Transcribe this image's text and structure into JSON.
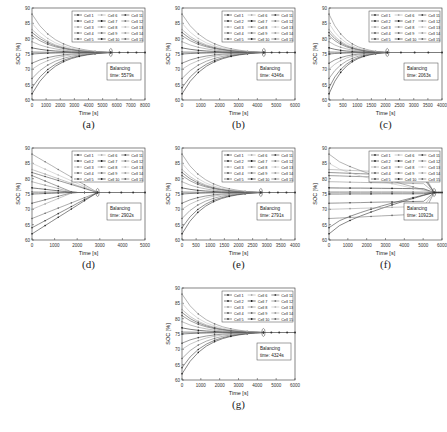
{
  "figure": {
    "cell_names": [
      "Cell 1",
      "Cell 2",
      "Cell 3",
      "Cell 4",
      "Cell 5",
      "Cell 6",
      "Cell 7",
      "Cell 8",
      "Cell 9",
      "Cell 10",
      "Cell 11",
      "Cell 12",
      "Cell 13",
      "Cell 14",
      "Cell 15"
    ],
    "initial_soc": [
      64,
      62,
      83,
      81,
      82,
      75.5,
      77,
      79,
      67,
      75,
      72,
      88,
      85,
      70,
      75.7
    ]
  },
  "chart_data": [
    {
      "id": "a",
      "caption": "(a)",
      "type": "line",
      "xlabel": "Time [s]",
      "ylabel": "SOC [%]",
      "xlim": [
        0,
        8000
      ],
      "ylim": [
        60,
        90
      ],
      "xticks": [
        0,
        1000,
        2000,
        3000,
        4000,
        5000,
        6000,
        7000,
        8000
      ],
      "yticks": [
        60,
        65,
        70,
        75,
        80,
        85,
        90
      ],
      "annotation": "Balancing time: 5579s",
      "balancing_time_s": 5579,
      "final_soc": 75.5,
      "grid": false,
      "legend_position": "upper right"
    },
    {
      "id": "b",
      "caption": "(b)",
      "type": "line",
      "xlabel": "Time [s]",
      "ylabel": "SOC [%]",
      "xlim": [
        0,
        6000
      ],
      "ylim": [
        60,
        90
      ],
      "xticks": [
        0,
        1000,
        2000,
        3000,
        4000,
        5000,
        6000
      ],
      "yticks": [
        60,
        65,
        70,
        75,
        80,
        85,
        90
      ],
      "annotation": "Balancing time: 4346s",
      "balancing_time_s": 4346,
      "final_soc": 75.5,
      "grid": false,
      "legend_position": "upper right"
    },
    {
      "id": "c",
      "caption": "(c)",
      "type": "line",
      "xlabel": "Time [s]",
      "ylabel": "SOC [%]",
      "xlim": [
        0,
        4000
      ],
      "ylim": [
        60,
        90
      ],
      "xticks": [
        0,
        500,
        1000,
        1500,
        2000,
        2500,
        3000,
        3500,
        4000
      ],
      "yticks": [
        60,
        65,
        70,
        75,
        80,
        85,
        90
      ],
      "annotation": "Balancing time: 2063s",
      "balancing_time_s": 2063,
      "final_soc": 75.5,
      "grid": false,
      "legend_position": "upper right"
    },
    {
      "id": "d",
      "caption": "(d)",
      "type": "line",
      "xlabel": "Time [s]",
      "ylabel": "SOC [%]",
      "xlim": [
        0,
        5000
      ],
      "ylim": [
        60,
        90
      ],
      "xticks": [
        0,
        1000,
        2000,
        3000,
        4000,
        5000
      ],
      "yticks": [
        60,
        65,
        70,
        75,
        80,
        85,
        90
      ],
      "annotation": "Balancing time: 2902s",
      "balancing_time_s": 2902,
      "final_soc": 75.5,
      "grid": false,
      "legend_position": "upper right"
    },
    {
      "id": "e",
      "caption": "(e)",
      "type": "line",
      "xlabel": "Time [s]",
      "ylabel": "SOC [%]",
      "xlim": [
        0,
        4000
      ],
      "ylim": [
        60,
        90
      ],
      "xticks": [
        0,
        500,
        1000,
        1500,
        2000,
        2500,
        3000,
        3500,
        4000
      ],
      "yticks": [
        60,
        65,
        70,
        75,
        80,
        85,
        90
      ],
      "annotation": "Balancing time: 2791s",
      "balancing_time_s": 2791,
      "final_soc": 75.5,
      "grid": false,
      "legend_position": "upper right"
    },
    {
      "id": "f",
      "caption": "(f)",
      "type": "line",
      "xlabel": "Time [s]",
      "ylabel": "SOC [%]",
      "xlim": [
        0,
        6000
      ],
      "ylim": [
        60,
        90
      ],
      "xticks": [
        0,
        1000,
        2000,
        3000,
        4000,
        5000,
        6000
      ],
      "yticks": [
        60,
        65,
        70,
        75,
        80,
        85,
        90
      ],
      "annotation": "Balancing time: 10923s",
      "balancing_time_s": 10923,
      "final_soc": 75.5,
      "grid": false,
      "legend_position": "upper right"
    },
    {
      "id": "g",
      "caption": "(g)",
      "type": "line",
      "xlabel": "Time [s]",
      "ylabel": "SOC [%]",
      "xlim": [
        0,
        6000
      ],
      "ylim": [
        60,
        90
      ],
      "xticks": [
        0,
        1000,
        2000,
        3000,
        4000,
        5000,
        6000
      ],
      "yticks": [
        60,
        65,
        70,
        75,
        80,
        85,
        90
      ],
      "annotation": "Balancing time: 4324s",
      "balancing_time_s": 4324,
      "final_soc": 75.5,
      "grid": false,
      "legend_position": "upper right"
    }
  ],
  "layout": {
    "panels": [
      {
        "id": "a",
        "x": 0,
        "y": 0
      },
      {
        "id": "b",
        "x": 150,
        "y": 0
      },
      {
        "id": "c",
        "x": 297,
        "y": 0
      },
      {
        "id": "d",
        "x": 0,
        "y": 140
      },
      {
        "id": "e",
        "x": 150,
        "y": 140
      },
      {
        "id": "f",
        "x": 297,
        "y": 140
      },
      {
        "id": "g",
        "x": 150,
        "y": 280
      }
    ]
  }
}
